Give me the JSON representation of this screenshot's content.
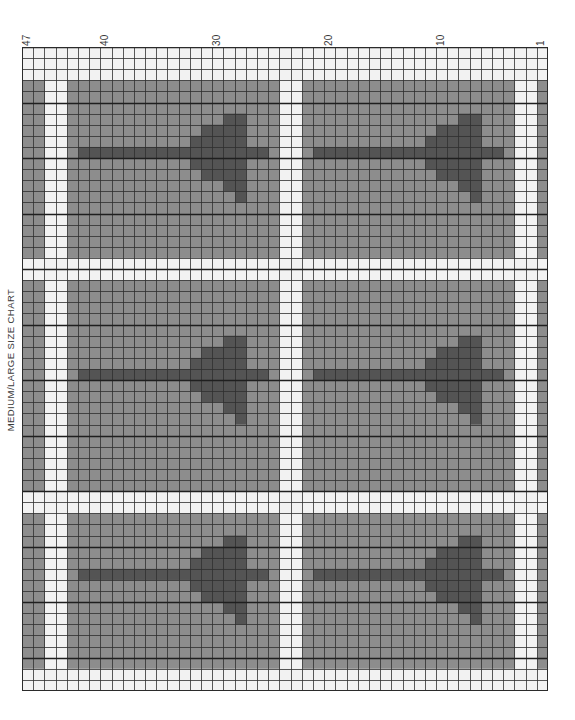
{
  "page": {
    "title": "MEDIUM/LARGE SIZE CHART",
    "background_color": "#ffffff"
  },
  "chart_data": {
    "type": "heatmap",
    "title": "MEDIUM/LARGE SIZE CHART",
    "xlabel": "",
    "ylabel": "",
    "grid": true,
    "legend_position": "none",
    "columns": 47,
    "rows": 58,
    "column_numbering_direction": "right-to-left",
    "column_tick_values": [
      1,
      10,
      20,
      30,
      40,
      47
    ],
    "colors": {
      "background_cell": "#8d8d8d",
      "motif_cell": "#545454",
      "gutter_cell": "#f2f2f2",
      "grid_line": "#2f2f2f",
      "heavy_grid_line": "#1f1f1f",
      "paper": "#ffffff",
      "text": "#3b3b3b"
    },
    "gutter_columns": [
      2,
      3,
      44,
      45,
      23,
      24
    ],
    "gutter_rows": [
      1,
      2,
      3,
      20,
      21,
      41,
      42,
      57,
      58
    ],
    "panels": [
      {
        "name": "panel-top-right",
        "col_start": 4,
        "col_end": 22,
        "row_start": 4,
        "row_end": 19
      },
      {
        "name": "panel-top-left",
        "col_start": 25,
        "col_end": 43,
        "row_start": 4,
        "row_end": 19
      },
      {
        "name": "panel-middle-right",
        "col_start": 4,
        "col_end": 22,
        "row_start": 22,
        "row_end": 40
      },
      {
        "name": "panel-middle-left",
        "col_start": 25,
        "col_end": 43,
        "row_start": 22,
        "row_end": 40
      },
      {
        "name": "panel-bottom-right",
        "col_start": 4,
        "col_end": 22,
        "row_start": 43,
        "row_end": 56
      },
      {
        "name": "panel-bottom-left",
        "col_start": 25,
        "col_end": 43,
        "row_start": 43,
        "row_end": 56
      }
    ],
    "motif": {
      "name": "arrow-tree-motif",
      "width": 17,
      "height": 9,
      "cells": [
        [
          2,
          0
        ],
        [
          3,
          0
        ],
        [
          2,
          1
        ],
        [
          3,
          1
        ],
        [
          4,
          1
        ],
        [
          5,
          1
        ],
        [
          2,
          2
        ],
        [
          3,
          2
        ],
        [
          4,
          2
        ],
        [
          5,
          2
        ],
        [
          6,
          2
        ],
        [
          0,
          3
        ],
        [
          1,
          3
        ],
        [
          2,
          3
        ],
        [
          3,
          3
        ],
        [
          4,
          3
        ],
        [
          5,
          3
        ],
        [
          6,
          3
        ],
        [
          7,
          3
        ],
        [
          8,
          3
        ],
        [
          9,
          3
        ],
        [
          10,
          3
        ],
        [
          11,
          3
        ],
        [
          12,
          3
        ],
        [
          13,
          3
        ],
        [
          14,
          3
        ],
        [
          15,
          3
        ],
        [
          16,
          3
        ],
        [
          2,
          4
        ],
        [
          3,
          4
        ],
        [
          4,
          4
        ],
        [
          5,
          4
        ],
        [
          6,
          4
        ],
        [
          2,
          5
        ],
        [
          3,
          5
        ],
        [
          4,
          5
        ],
        [
          5,
          5
        ],
        [
          2,
          6
        ],
        [
          3,
          6
        ],
        [
          2,
          7
        ]
      ]
    }
  },
  "axis": {
    "column_labels": [
      {
        "value": "47",
        "column": 47
      },
      {
        "value": "40",
        "column": 40
      },
      {
        "value": "30",
        "column": 30
      },
      {
        "value": "20",
        "column": 20
      },
      {
        "value": "10",
        "column": 10
      },
      {
        "value": "1",
        "column": 1
      }
    ]
  }
}
